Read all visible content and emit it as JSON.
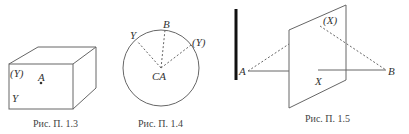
{
  "figures": [
    {
      "id": "fig-1-3",
      "caption": "Рис. П. 1.3",
      "shape": "cube",
      "labels": {
        "top_left": "(Y)",
        "point": "A",
        "bottom_left": "Y"
      }
    },
    {
      "id": "fig-1-4",
      "caption": "Рис. П. 1.4",
      "shape": "circle",
      "labels": {
        "left": "Y",
        "top": "B",
        "right": "(Y)",
        "center": "CA"
      }
    },
    {
      "id": "fig-1-5",
      "caption": "Рис. П. 1.5",
      "shape": "plane-with-rays",
      "labels": {
        "left_point": "A",
        "right_point": "B",
        "reflection": "(X)",
        "line": "X"
      }
    }
  ],
  "colors": {
    "stroke": "#555555",
    "bar": "#111111",
    "text": "#333333"
  }
}
